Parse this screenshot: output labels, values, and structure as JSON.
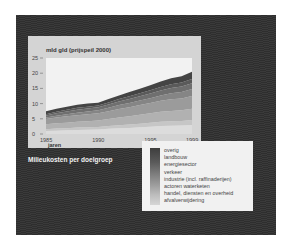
{
  "chart_data": {
    "type": "area",
    "stacked": true,
    "title": "mld gld (prijspeil 2000)",
    "ylabel": "mld gld (prijspeil 2000)",
    "xlabel": "jaren",
    "caption": "Milieukosten per doelgroep",
    "ylim": [
      0,
      25
    ],
    "yticks": [
      "25",
      "20",
      "15",
      "10",
      "5",
      "0"
    ],
    "xticks": [
      "1985",
      "1990",
      "1995",
      "1999"
    ],
    "x": [
      1985,
      1986,
      1987,
      1988,
      1989,
      1990,
      1991,
      1992,
      1993,
      1994,
      1995,
      1996,
      1997,
      1998,
      1999
    ],
    "total": [
      7.5,
      8.3,
      9.0,
      9.6,
      10.0,
      10.3,
      11.5,
      12.7,
      13.8,
      14.9,
      16.0,
      17.3,
      18.3,
      19.0,
      20.5
    ],
    "series": [
      {
        "name": "afvalverwijdering",
        "values": [
          1.0,
          1.1,
          1.2,
          1.3,
          1.4,
          1.5,
          1.7,
          1.9,
          2.0,
          2.2,
          2.4,
          2.6,
          2.7,
          2.8,
          3.0
        ]
      },
      {
        "name": "handel, diensten en overheid",
        "values": [
          0.6,
          0.7,
          0.7,
          0.8,
          0.8,
          0.8,
          0.9,
          1.0,
          1.1,
          1.2,
          1.3,
          1.4,
          1.5,
          1.5,
          1.6
        ]
      },
      {
        "name": "actoren waterketen",
        "values": [
          1.6,
          1.7,
          1.8,
          1.9,
          2.0,
          2.1,
          2.3,
          2.5,
          2.7,
          2.9,
          3.1,
          3.3,
          3.4,
          3.5,
          3.7
        ]
      },
      {
        "name": "industrie (incl. raffinaderijen)",
        "values": [
          1.7,
          1.9,
          2.1,
          2.2,
          2.3,
          2.4,
          2.6,
          2.8,
          3.0,
          3.2,
          3.4,
          3.6,
          3.8,
          3.9,
          4.2
        ]
      },
      {
        "name": "verkeer",
        "values": [
          0.5,
          0.6,
          0.7,
          0.8,
          0.9,
          1.0,
          1.1,
          1.3,
          1.4,
          1.5,
          1.6,
          1.8,
          2.0,
          2.1,
          2.3
        ]
      },
      {
        "name": "energiesector",
        "values": [
          0.7,
          0.8,
          0.9,
          1.0,
          1.0,
          1.0,
          1.1,
          1.2,
          1.3,
          1.4,
          1.5,
          1.6,
          1.7,
          1.8,
          1.9
        ]
      },
      {
        "name": "landbouw",
        "values": [
          0.4,
          0.5,
          0.6,
          0.6,
          0.6,
          0.6,
          0.7,
          0.8,
          0.9,
          1.0,
          1.1,
          1.2,
          1.3,
          1.3,
          1.4
        ]
      },
      {
        "name": "overig",
        "values": [
          1.0,
          1.0,
          1.0,
          1.0,
          1.0,
          0.9,
          1.1,
          1.2,
          1.4,
          1.5,
          1.6,
          1.8,
          1.9,
          2.1,
          2.4
        ]
      }
    ],
    "legend": [
      "overig",
      "landbouw",
      "energiesector",
      "verkeer",
      "industrie (incl. raffinaderijen)",
      "actoren waterketen",
      "handel, diensten en overheid",
      "afvalverwijdering"
    ],
    "legend_position": "bottom-right",
    "grid": false,
    "colors": {
      "panel_bg": "#333333",
      "chart_card_bg": "#d4d4d4",
      "plot_bg": "#f2f2f2",
      "legend_bg": "#f1f1f1",
      "darkest_band": "#444444",
      "lightest_band": "#dcdcdc"
    }
  }
}
